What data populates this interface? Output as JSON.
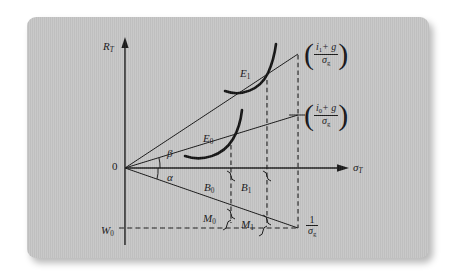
{
  "figure": {
    "type": "economic-diagram",
    "background_color": "#c6c6c6",
    "ink_color": "#1a1a1a"
  },
  "axes": {
    "y_label": "R",
    "y_label_sub": "T",
    "x_label": "σ",
    "x_label_sub": "T",
    "origin_label": "0"
  },
  "angles": [
    {
      "name": "beta",
      "glyph": "β",
      "position": "above-x-axis"
    },
    {
      "name": "alpha",
      "glyph": "α",
      "position": "below-x-axis"
    }
  ],
  "equilibria": [
    {
      "id": "E0",
      "letter": "E",
      "sub": "0"
    },
    {
      "id": "E1",
      "letter": "E",
      "sub": "1"
    }
  ],
  "ray_endpoint_labels": [
    {
      "id": "upper",
      "numerator_var": "i",
      "numerator_sub": "1",
      "numerator_rest": "+ g",
      "denominator_var": "σ",
      "denominator_sub": "g"
    },
    {
      "id": "lower",
      "numerator_var": "i",
      "numerator_sub": "0",
      "numerator_rest": "+ g",
      "denominator_var": "σ",
      "denominator_sub": "g"
    }
  ],
  "bond_brackets": [
    {
      "id": "B0",
      "letter": "B",
      "sub": "0"
    },
    {
      "id": "B1",
      "letter": "B",
      "sub": "1"
    }
  ],
  "money_brackets": [
    {
      "id": "M0",
      "letter": "M",
      "sub": "0"
    },
    {
      "id": "M1",
      "letter": "M",
      "sub": "1"
    }
  ],
  "wealth_label": {
    "letter": "W",
    "sub": "0"
  },
  "max_sigma_label": {
    "numerator": "1",
    "denominator_var": "σ",
    "denominator_sub": "g"
  }
}
